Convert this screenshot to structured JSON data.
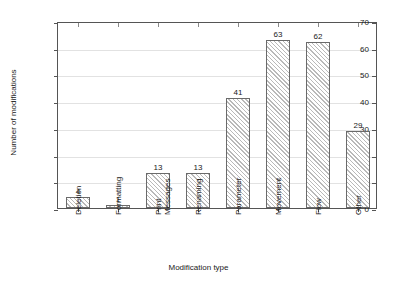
{
  "chart_data": {
    "type": "bar",
    "title": "",
    "xlabel": "Modification type",
    "ylabel": "Number of modifications",
    "categories": [
      "Deletion",
      "Formatting",
      "Print\nMessages",
      "Renaming",
      "Parameter",
      "Movement",
      "Flow",
      "Other"
    ],
    "values": [
      4,
      1,
      13,
      13,
      41,
      63,
      62,
      29
    ],
    "value_labels": [
      "4",
      "1",
      "13",
      "13",
      "41",
      "63",
      "62",
      "29"
    ],
    "ylim": [
      0,
      70
    ],
    "ytick_labels": [
      "0",
      "10",
      "20",
      "30",
      "40",
      "50",
      "60",
      "70"
    ],
    "ytick_values": [
      0,
      10,
      20,
      30,
      40,
      50,
      60,
      70
    ],
    "grid": true,
    "legend": false,
    "bar_fill": "hatched-diagonal",
    "colors": {
      "bar_edge": "#6a6a6a",
      "bar_hatch": "#b9b9b9",
      "axis": "#555555",
      "grid": "#e2e2e2",
      "text": "#1a1a1a",
      "background": "#ffffff"
    }
  }
}
